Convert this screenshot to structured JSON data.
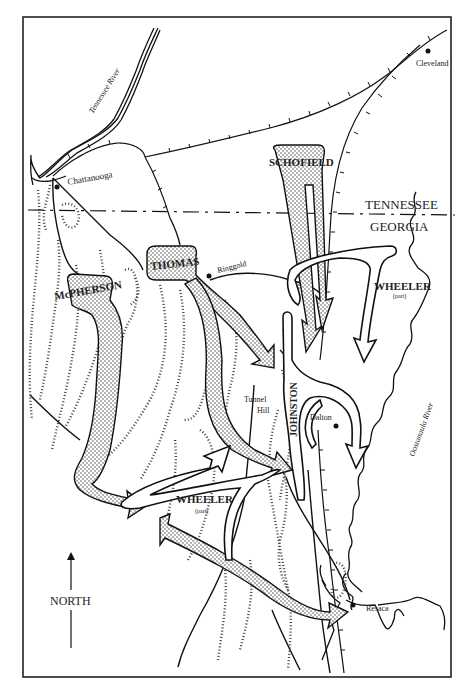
{
  "map": {
    "title": "",
    "states": {
      "north": "TENNESSEE",
      "south": "GEORGIA"
    },
    "rivers": [
      {
        "name": "Tennessee River"
      },
      {
        "name": "Oostanaula River"
      }
    ],
    "towns": [
      {
        "name": "Chattanooga"
      },
      {
        "name": "Cleveland"
      },
      {
        "name": "Ringgold"
      },
      {
        "name": "Tunnel Hill",
        "line1": "Tunnel",
        "line2": "Hill"
      },
      {
        "name": "Dalton"
      },
      {
        "name": "Resaca"
      }
    ],
    "union_forces": [
      {
        "name": "SCHOFIELD"
      },
      {
        "name": "THOMAS"
      },
      {
        "name": "McPHERSON"
      }
    ],
    "confederate_forces": [
      {
        "name": "JOHNSTON"
      },
      {
        "name": "WHEELER",
        "note": "(part)"
      },
      {
        "name": "WHEELER",
        "note": "(part)"
      }
    ],
    "compass": {
      "label": "NORTH"
    }
  }
}
